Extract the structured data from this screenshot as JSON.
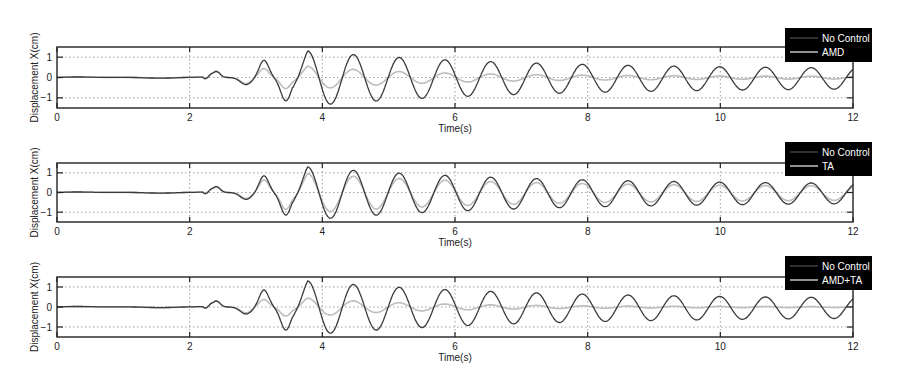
{
  "chart_data": [
    {
      "type": "line",
      "title": "",
      "xlabel": "Time(s)",
      "ylabel": "Displacement X(cm)",
      "xlim": [
        0,
        12
      ],
      "ylim": [
        -1.5,
        1.5
      ],
      "xticks": [
        "0",
        "2",
        "4",
        "6",
        "8",
        "10",
        "12"
      ],
      "yticks": [
        "-1",
        "0",
        "1"
      ],
      "grid": "dotted",
      "legend_position": "upper right (outside, black box)",
      "legend": [
        "No Control",
        "AMD"
      ],
      "series": [
        {
          "name": "No Control",
          "color": "#444444",
          "peak_times": [
            3.78,
            4.47,
            5.16,
            5.85,
            6.54,
            7.23,
            7.92,
            8.61,
            9.3,
            9.99,
            10.68,
            11.37
          ],
          "peak_values": [
            1.35,
            1.3,
            1.25,
            1.2,
            1.1,
            1.0,
            0.85,
            0.75,
            0.65,
            0.6,
            0.5,
            0.45
          ],
          "trough_values": [
            -1.2,
            -1.2,
            -1.15,
            -1.1,
            -1.05,
            -0.9,
            -0.8,
            -0.7,
            -0.6,
            -0.55,
            -0.5,
            -0.4
          ],
          "pre_event": "≈0 for t<2.2; bumps 0.3 at 2.4, -0.35 at 2.85, 0.85 at 3.15, -1.15 at 3.45"
        },
        {
          "name": "AMD",
          "color": "#bbbbbb",
          "peak_times": [
            3.78,
            4.47,
            5.16,
            5.85,
            6.54,
            7.23,
            7.92
          ],
          "peak_values": [
            0.65,
            0.55,
            0.45,
            0.4,
            0.3,
            0.2,
            0.15
          ],
          "trough_values": [
            -0.5,
            -0.5,
            -0.45,
            -0.4,
            -0.3,
            -0.2,
            -0.1
          ],
          "decay_note": "nearly flat (<0.1) after 8s"
        }
      ]
    },
    {
      "type": "line",
      "title": "",
      "xlabel": "Time(s)",
      "ylabel": "Displacement X(cm)",
      "xlim": [
        0,
        12
      ],
      "ylim": [
        -1.5,
        1.5
      ],
      "xticks": [
        "0",
        "2",
        "4",
        "6",
        "8",
        "10",
        "12"
      ],
      "yticks": [
        "-1",
        "0",
        "1"
      ],
      "grid": "dotted",
      "legend_position": "upper right (outside, black box)",
      "legend": [
        "No Control",
        "TA"
      ],
      "series": [
        {
          "name": "No Control",
          "color": "#444444",
          "peak_values": [
            1.35,
            1.3,
            1.25,
            1.2,
            1.1,
            1.0,
            0.85,
            0.75,
            0.65,
            0.6,
            0.5,
            0.45
          ]
        },
        {
          "name": "TA",
          "color": "#bbbbbb",
          "peak_values": [
            1.0,
            0.9,
            0.85,
            0.8,
            0.75,
            0.65,
            0.55,
            0.5,
            0.45,
            0.4,
            0.35,
            0.3
          ],
          "note": "close to No Control, ~70-80% amplitude"
        }
      ]
    },
    {
      "type": "line",
      "title": "",
      "xlabel": "Time(s)",
      "ylabel": "Displacement X(cm)",
      "xlim": [
        0,
        12
      ],
      "ylim": [
        -1.5,
        1.5
      ],
      "xticks": [
        "0",
        "2",
        "4",
        "6",
        "8",
        "10",
        "12"
      ],
      "yticks": [
        "-1",
        "0",
        "1"
      ],
      "grid": "dotted",
      "legend_position": "upper right (outside, black box)",
      "legend": [
        "No Control",
        "AMD+TA"
      ],
      "series": [
        {
          "name": "No Control",
          "color": "#444444",
          "peak_values": [
            1.35,
            1.3,
            1.25,
            1.2,
            1.1,
            1.0,
            0.85,
            0.75,
            0.65,
            0.6,
            0.5,
            0.45
          ]
        },
        {
          "name": "AMD+TA",
          "color": "#bbbbbb",
          "peak_values": [
            0.55,
            0.4,
            0.3,
            0.2,
            0.15,
            0.1,
            0.05
          ],
          "note": "near zero after ~7s"
        }
      ]
    }
  ],
  "panels": [
    {
      "ylabel": "Displacement X(cm)",
      "xlabel": "Time(s)",
      "legend": [
        "No Control",
        "AMD"
      ],
      "ctrl_scale": [
        0.48,
        0.12
      ]
    },
    {
      "ylabel": "Displacement X(cm)",
      "xlabel": "Time(s)",
      "legend": [
        "No Control",
        "TA"
      ],
      "ctrl_scale": [
        0.75,
        0.7
      ]
    },
    {
      "ylabel": "Displacement X(cm)",
      "xlabel": "Time(s)",
      "legend": [
        "No Control",
        "AMD+TA"
      ],
      "ctrl_scale": [
        0.4,
        0.03
      ]
    }
  ],
  "axes": {
    "xticks": [
      "0",
      "2",
      "4",
      "6",
      "8",
      "10",
      "12"
    ],
    "yticks": [
      "1",
      "0",
      "-1"
    ]
  },
  "colors": {
    "uncontrolled": "#3a3a3a",
    "controlled": "#bdbdbd",
    "legend_bg": "#000000",
    "grid": "#888888"
  }
}
